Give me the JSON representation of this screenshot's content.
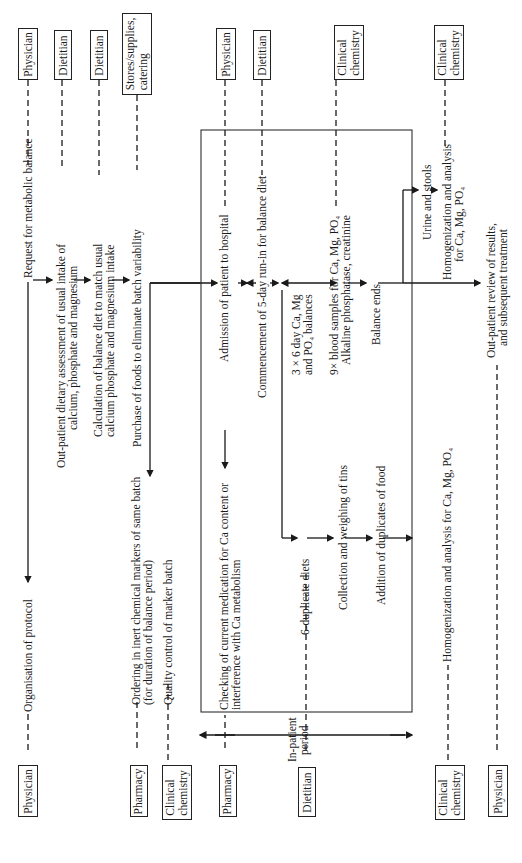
{
  "actors": {
    "top": [
      {
        "label": "Physician"
      },
      {
        "label": "Dietitian"
      },
      {
        "label": "Dietitian"
      },
      {
        "label": "Stores/supplies,\ncatering"
      },
      {
        "label": "Physician"
      },
      {
        "label": "Dietitian"
      },
      {
        "label": "Clinical\nchemistry"
      },
      {
        "label": "Clinical\nchemistry"
      }
    ],
    "bottom": [
      {
        "label": "Physician"
      },
      {
        "label": "Pharmacy"
      },
      {
        "label": "Clinical\nchemistry"
      },
      {
        "label": "Pharmacy"
      },
      {
        "label": "Dietitian"
      },
      {
        "label": "Clinical\nchemistry"
      },
      {
        "label": "Physician"
      }
    ]
  },
  "steps": {
    "request": "Request for metabolic balance",
    "organisation": "Organisation of protocol",
    "outpatient_assessment_1": "Out-patient dietary assessment of usual intake of",
    "outpatient_assessment_2": "calcium, phosphate and magnesium",
    "calculation_1": "Calculation of balance diet to match usual",
    "calculation_2": "calcium phosphate and magnesium intake",
    "purchase": "Purchase of foods to eliminate batch variability",
    "ordering_1": "Ordering in inert chemical markers of same batch",
    "ordering_2": "(for duration of balance period)",
    "quality_control": "Quality control of marker batch",
    "admission": "Admission of patient to hospital",
    "checking_1": "Checking of current medication for Ca content or",
    "checking_2": "interference with Ca metabolism",
    "commencement": "Commencement of 5-day run-in for balance diet",
    "balances_1": "3 × 6 day Ca, Mg",
    "balances_2": "and PO₄ balances",
    "duplicate_diets": "6-duplicate diets",
    "blood_samples_1": "9× blood samples for Ca, Mg, PO₄",
    "blood_samples_2": "Alkaline  phosphatase, creatinine",
    "collection": "Collection and weighing of tins",
    "balance_ends": "Balance ends",
    "addition": "Addition of duplicates of food",
    "urine_stools": "Urine and stools",
    "homog_top_1": "Homogenization and analysis",
    "homog_top_2": "for Ca, Mg, PO₄",
    "homog_bottom": "Homogenization and analysis for Ca, Mg, PO₄",
    "review_1": "Out-patient review of results,",
    "review_2": "and subsequent treatment"
  },
  "inpatient": {
    "label_1": "In-patient",
    "label_2": "period"
  }
}
